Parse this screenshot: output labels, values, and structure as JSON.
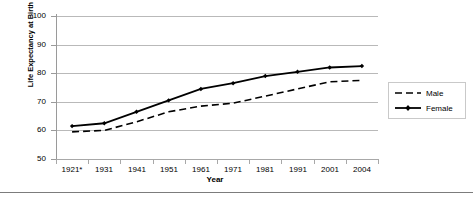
{
  "chart_data": {
    "type": "line",
    "title": "",
    "xlabel": "Year",
    "ylabel": "Life Expectancy at Birth",
    "categories": [
      "1921*",
      "1931",
      "1941",
      "1951",
      "1961",
      "1971",
      "1981",
      "1991",
      "2001",
      "2004"
    ],
    "ylim": [
      50,
      100
    ],
    "yticks": [
      50,
      60,
      70,
      80,
      90,
      100
    ],
    "grid": true,
    "legend_position": "right",
    "series": [
      {
        "name": "Male",
        "style": "dashed",
        "marker": "none",
        "color": "#000000",
        "values": [
          59.5,
          60.0,
          63.0,
          66.5,
          68.5,
          69.5,
          72.0,
          74.5,
          77.0,
          77.5
        ]
      },
      {
        "name": "Female",
        "style": "solid",
        "marker": "diamond",
        "color": "#000000",
        "values": [
          61.5,
          62.5,
          66.5,
          70.5,
          74.5,
          76.5,
          79.0,
          80.5,
          82.0,
          82.5
        ]
      }
    ]
  },
  "axis": {
    "y_title": "Life Expectancy at Birth",
    "x_title": "Year"
  },
  "legend": {
    "male_label": "Male",
    "female_label": "Female"
  }
}
